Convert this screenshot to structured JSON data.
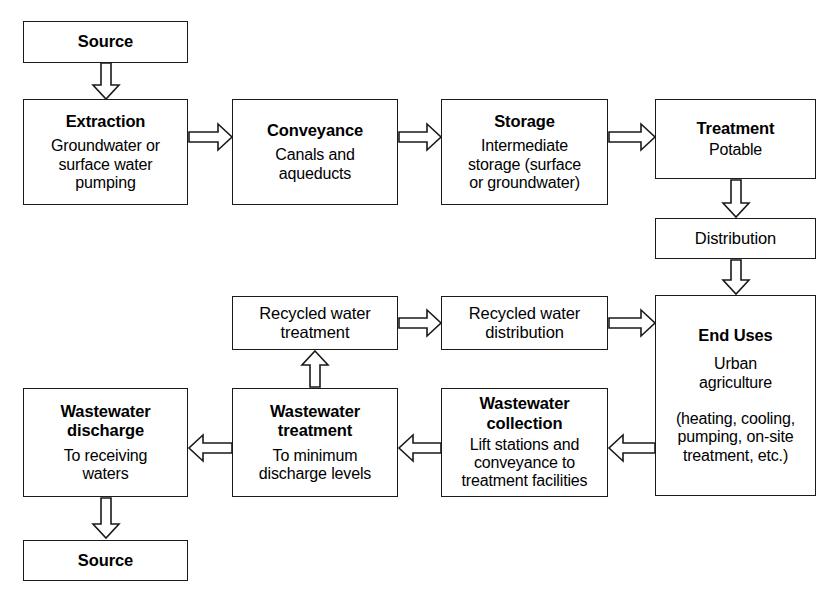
{
  "diagram": {
    "stroke_color": "#1a1a1a",
    "background_color": "#ffffff",
    "nodes": [
      {
        "id": "source_top",
        "title": "Source",
        "sub": ""
      },
      {
        "id": "extraction",
        "title": "Extraction",
        "sub": "Groundwater or\nsurface water\npumping"
      },
      {
        "id": "conveyance",
        "title": "Conveyance",
        "sub": "Canals and\naqueducts"
      },
      {
        "id": "storage",
        "title": "Storage",
        "sub": "Intermediate\nstorage (surface\nor groundwater)"
      },
      {
        "id": "treatment",
        "title": "Treatment",
        "sub": "Potable"
      },
      {
        "id": "distribution",
        "title": "Distribution",
        "sub": ""
      },
      {
        "id": "end_uses",
        "title": "End Uses",
        "sub": "Urban\nagriculture\n\n(heating, cooling,\npumping, on-site\ntreatment, etc.)"
      },
      {
        "id": "rw_distribution",
        "title": "Recycled water\ndistribution",
        "sub": ""
      },
      {
        "id": "rw_treatment",
        "title": "Recycled water\ntreatment",
        "sub": ""
      },
      {
        "id": "ww_collection",
        "title": "Wastewater\ncollection",
        "sub": "Lift stations and\nconveyance to\ntreatment facilities"
      },
      {
        "id": "ww_treatment",
        "title": "Wastewater\ntreatment",
        "sub": "To minimum\ndischarge levels"
      },
      {
        "id": "ww_discharge",
        "title": "Wastewater\ndischarge",
        "sub": "To receiving\nwaters"
      },
      {
        "id": "source_bottom",
        "title": "Source",
        "sub": ""
      }
    ],
    "edges": [
      {
        "id": "e1",
        "from": "source_top",
        "to": "extraction",
        "direction": "down"
      },
      {
        "id": "e2",
        "from": "extraction",
        "to": "conveyance",
        "direction": "right"
      },
      {
        "id": "e3",
        "from": "conveyance",
        "to": "storage",
        "direction": "right"
      },
      {
        "id": "e4",
        "from": "storage",
        "to": "treatment",
        "direction": "right"
      },
      {
        "id": "e5",
        "from": "treatment",
        "to": "distribution",
        "direction": "down"
      },
      {
        "id": "e6",
        "from": "distribution",
        "to": "end_uses",
        "direction": "down"
      },
      {
        "id": "e7",
        "from": "end_uses",
        "to": "ww_collection",
        "direction": "left"
      },
      {
        "id": "e8",
        "from": "ww_collection",
        "to": "ww_treatment",
        "direction": "left"
      },
      {
        "id": "e9",
        "from": "ww_treatment",
        "to": "ww_discharge",
        "direction": "left"
      },
      {
        "id": "e10",
        "from": "ww_discharge",
        "to": "source_bottom",
        "direction": "down"
      },
      {
        "id": "e11",
        "from": "ww_treatment",
        "to": "rw_treatment",
        "direction": "up"
      },
      {
        "id": "e12",
        "from": "rw_treatment",
        "to": "rw_distribution",
        "direction": "right"
      },
      {
        "id": "e13",
        "from": "rw_distribution",
        "to": "end_uses",
        "direction": "right"
      }
    ]
  }
}
